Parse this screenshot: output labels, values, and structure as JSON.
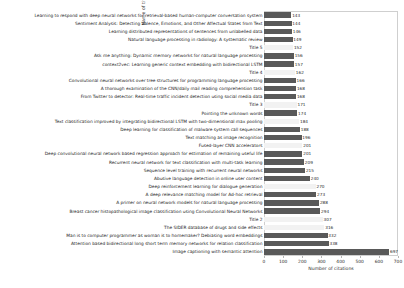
{
  "chart_data": {
    "type": "bar",
    "orientation": "horizontal",
    "title": "",
    "xlabel": "Number of citations",
    "ylabel": "Name of title",
    "xlim": [
      0,
      700
    ],
    "xticks": [
      0,
      100,
      200,
      300,
      400,
      500,
      600,
      700
    ],
    "grid": false,
    "legend": false,
    "bar_color": "#595959",
    "highlight_color": "#f2f2f2",
    "categories": [
      "Learning to respond with deep neural networks for retrieval-based human-computer conversation system",
      "Sentiment Analysis: Detecting Valence, Emotions, and Other Affectual States from Text",
      "Learning distributed representations of sentences from unlabelled data",
      "Natural language processing in radiology: A systematic review",
      "Title 5",
      "Ask me anything: Dynamic memory networks for natural language processing",
      "context2vec: Learning generic context embedding with bidirectional LSTM",
      "Title 4",
      "Convolutional neural networks over tree structures for programming language processing",
      "A thorough examination of the CNN/daily mail reading comprehension task",
      "From Twitter to detector: Real-time traffic incident detection using social media data",
      "Title 3",
      "Pointing the unknown words",
      "Text classification improved by integrating bidirectional LSTM with two-dimensional max pooling",
      "Deep learning for classification of malware system call sequences",
      "Text matching as image recognition",
      "Fused-layer CNN accelerators",
      "Deep convolutional neural network based regression approach for estimation of remaining useful life",
      "Recurrent neural network for text classification with multi-task learning",
      "Sequence level training with recurrent neural networks",
      "Abusive language detection in online user content",
      "Deep reinforcement learning for dialogue generation",
      "A deep relevance matching model for Ad-hoc retrieval",
      "A primer on neural network models for natural language processing",
      "Breast cancer histopathological image classification using Convolutional Neural Networks",
      "Title 2",
      "The SIDER database of drugs and side effects",
      "Man is to computer programmer as woman is to homemaker? Debiasing word embeddings",
      "Attention based bidirectional long short term memory networks for relation classification",
      "Image captioning with semantic attention"
    ],
    "values": [
      143,
      144,
      146,
      149,
      152,
      156,
      157,
      162,
      166,
      168,
      168,
      171,
      174,
      184,
      188,
      196,
      201,
      201,
      209,
      215,
      240,
      270,
      273,
      288,
      294,
      307,
      316,
      332,
      338,
      697
    ],
    "highlighted": [
      false,
      false,
      false,
      false,
      true,
      false,
      false,
      true,
      false,
      false,
      false,
      true,
      false,
      true,
      false,
      false,
      true,
      false,
      false,
      false,
      false,
      true,
      false,
      false,
      false,
      true,
      true,
      false,
      false,
      false
    ]
  }
}
